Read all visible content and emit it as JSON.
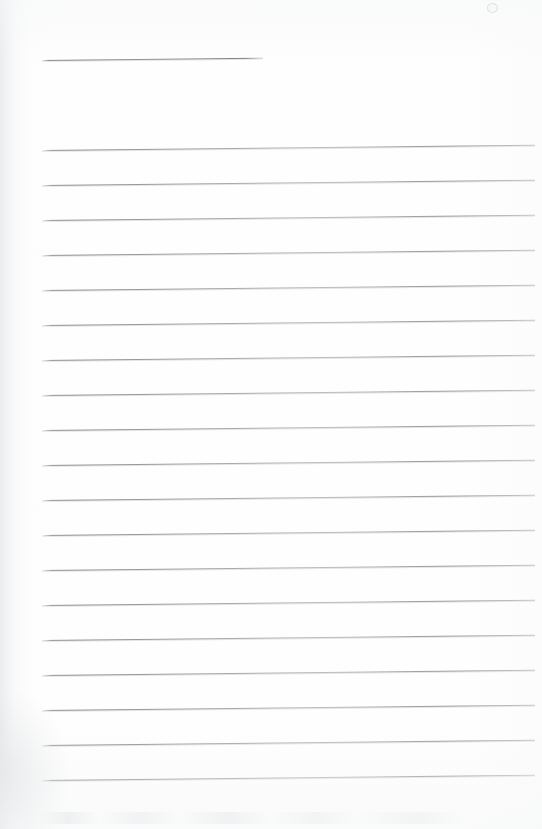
{
  "document": {
    "kind": "scanned-lined-paper",
    "title": "Blank ruled notebook page",
    "page_width": 542,
    "page_height": 829,
    "background_color": "#fefefe",
    "rule_color": "#8a8c91",
    "rule_shadow_color": "#cdcfd2",
    "text_content": "",
    "body_text": ""
  },
  "layout": {
    "rule_left_x": 42,
    "rule_right_x": 535,
    "rule_spacing_px": 35,
    "rule_tilt_deg": -0.62,
    "first_rule_y": 60,
    "body_first_rule_y": 150,
    "body_last_rule_y": 780
  },
  "rules": [
    {
      "name": "header-rule",
      "y": 60,
      "x": 42,
      "width": 221,
      "short": true
    },
    {
      "name": "body-rule-1",
      "y": 150,
      "x": 42,
      "width": 493,
      "short": false
    },
    {
      "name": "body-rule-2",
      "y": 185,
      "x": 42,
      "width": 493,
      "short": false
    },
    {
      "name": "body-rule-3",
      "y": 220,
      "x": 42,
      "width": 493,
      "short": false
    },
    {
      "name": "body-rule-4",
      "y": 255,
      "x": 42,
      "width": 493,
      "short": false
    },
    {
      "name": "body-rule-5",
      "y": 290,
      "x": 42,
      "width": 493,
      "short": false
    },
    {
      "name": "body-rule-6",
      "y": 325,
      "x": 42,
      "width": 493,
      "short": false
    },
    {
      "name": "body-rule-7",
      "y": 360,
      "x": 42,
      "width": 493,
      "short": false
    },
    {
      "name": "body-rule-8",
      "y": 395,
      "x": 42,
      "width": 493,
      "short": false
    },
    {
      "name": "body-rule-9",
      "y": 430,
      "x": 42,
      "width": 493,
      "short": false
    },
    {
      "name": "body-rule-10",
      "y": 465,
      "x": 42,
      "width": 493,
      "short": false
    },
    {
      "name": "body-rule-11",
      "y": 500,
      "x": 42,
      "width": 493,
      "short": false
    },
    {
      "name": "body-rule-12",
      "y": 535,
      "x": 42,
      "width": 493,
      "short": false
    },
    {
      "name": "body-rule-13",
      "y": 570,
      "x": 42,
      "width": 493,
      "short": false
    },
    {
      "name": "body-rule-14",
      "y": 605,
      "x": 42,
      "width": 493,
      "short": false
    },
    {
      "name": "body-rule-15",
      "y": 640,
      "x": 42,
      "width": 493,
      "short": false
    },
    {
      "name": "body-rule-16",
      "y": 675,
      "x": 42,
      "width": 493,
      "short": false
    },
    {
      "name": "body-rule-17",
      "y": 710,
      "x": 42,
      "width": 493,
      "short": false
    },
    {
      "name": "body-rule-18",
      "y": 745,
      "x": 42,
      "width": 493,
      "short": false
    },
    {
      "name": "body-rule-19",
      "y": 780,
      "x": 42,
      "width": 493,
      "short": false
    }
  ],
  "artifacts": [
    {
      "name": "scan-fleck-top-right",
      "x": 487,
      "y": 3,
      "size": 9
    }
  ]
}
